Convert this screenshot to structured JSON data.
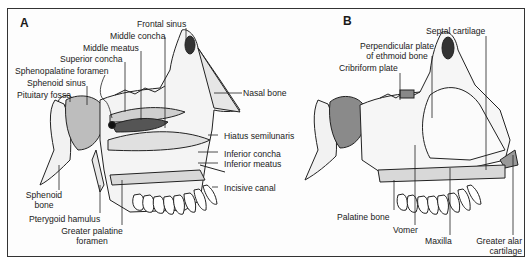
{
  "figure": {
    "panels": [
      {
        "id": "A",
        "letter": "A",
        "labels": {
          "frontal_sinus": "Frontal sinus",
          "middle_concha": "Middle concha",
          "middle_meatus": "Middle meatus",
          "superior_concha": "Superior concha",
          "sphenopalatine_foramen": "Sphenopalatine foramen",
          "sphenoid_sinus": "Sphenoid sinus",
          "pituitary_fossa": "Pituitary fossa",
          "nasal_bone": "Nasal bone",
          "hiatus_semilunaris": "Hiatus semilunaris",
          "inferior_concha": "Inferior concha",
          "inferior_meatus": "Inferior meatus",
          "incisive_canal": "Incisive canal",
          "sphenoid_bone_1": "Sphenoid",
          "sphenoid_bone_2": "bone",
          "pterygoid_hamulus": "Pterygoid hamulus",
          "greater_palatine_foramen_1": "Greater palatine",
          "greater_palatine_foramen_2": "foramen"
        }
      },
      {
        "id": "B",
        "letter": "B",
        "labels": {
          "septal_cartilage": "Septal cartilage",
          "perpendicular_plate_1": "Perpendicular plate",
          "perpendicular_plate_2": "of ethmoid bone",
          "cribriform_plate": "Cribriform plate",
          "palatine_bone": "Palatine bone",
          "vomer": "Vomer",
          "maxilla": "Maxilla",
          "greater_alar_cartilage_1": "Greater alar",
          "greater_alar_cartilage_2": "cartilage"
        }
      }
    ]
  }
}
